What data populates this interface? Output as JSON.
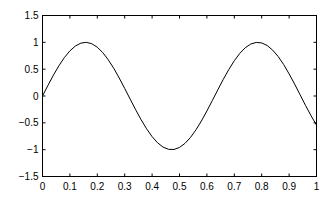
{
  "chart_data": {
    "type": "line",
    "title": "",
    "xlabel": "",
    "ylabel": "",
    "xlim": [
      0,
      1
    ],
    "ylim": [
      -1.5,
      1.5
    ],
    "grid": false,
    "legend": null,
    "x_ticks": [
      0,
      0.1,
      0.2,
      0.3,
      0.4,
      0.5,
      0.6,
      0.7,
      0.8,
      0.9,
      1
    ],
    "x_tick_labels": [
      "0",
      "0.1",
      "0.2",
      "0.3",
      "0.4",
      "0.5",
      "0.6",
      "0.7",
      "0.8",
      "0.9",
      "1"
    ],
    "y_ticks": [
      -1.5,
      -1,
      -0.5,
      0,
      0.5,
      1,
      1.5
    ],
    "y_tick_labels": [
      "-1.5",
      "-1",
      "-0.5",
      "0",
      "0.5",
      "1",
      "1.5"
    ],
    "series": [
      {
        "name": "sin(10x)",
        "color": "#000000",
        "x": [
          0,
          0.02,
          0.04,
          0.06,
          0.08,
          0.1,
          0.12,
          0.14,
          0.16,
          0.18,
          0.2,
          0.22,
          0.24,
          0.26,
          0.28,
          0.3,
          0.32,
          0.34,
          0.36,
          0.38,
          0.4,
          0.42,
          0.44,
          0.46,
          0.48,
          0.5,
          0.52,
          0.54,
          0.56,
          0.58,
          0.6,
          0.62,
          0.64,
          0.66,
          0.68,
          0.7,
          0.72,
          0.74,
          0.76,
          0.78,
          0.8,
          0.82,
          0.84,
          0.86,
          0.88,
          0.9,
          0.92,
          0.94,
          0.96,
          0.98,
          1
        ],
        "y": [
          0.0,
          0.199,
          0.389,
          0.565,
          0.717,
          0.841,
          0.932,
          0.985,
          1.0,
          0.974,
          0.909,
          0.808,
          0.675,
          0.516,
          0.335,
          0.141,
          -0.058,
          -0.256,
          -0.443,
          -0.612,
          -0.757,
          -0.872,
          -0.952,
          -0.994,
          -0.996,
          -0.959,
          -0.883,
          -0.773,
          -0.631,
          -0.465,
          -0.279,
          -0.083,
          0.117,
          0.312,
          0.494,
          0.657,
          0.794,
          0.899,
          0.968,
          0.998,
          0.989,
          0.941,
          0.855,
          0.737,
          0.588,
          0.412,
          0.223,
          0.024,
          -0.176,
          -0.366,
          -0.544
        ]
      }
    ]
  }
}
